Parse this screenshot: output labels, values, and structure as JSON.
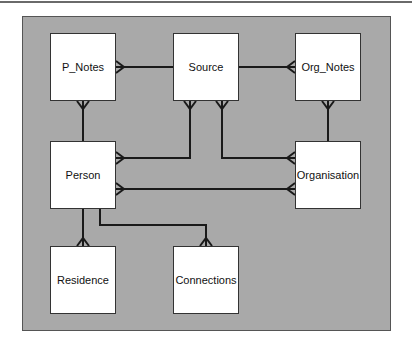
{
  "diagram": {
    "type": "entity-relationship",
    "colors": {
      "background": "#a9a9a9",
      "entity_fill": "#ffffff",
      "line": "#1a1a1a"
    },
    "entities": [
      {
        "id": "p_notes",
        "label": "P_Notes"
      },
      {
        "id": "source",
        "label": "Source"
      },
      {
        "id": "org_notes",
        "label": "Org_Notes"
      },
      {
        "id": "person",
        "label": "Person"
      },
      {
        "id": "organisation",
        "label": "Organisation"
      },
      {
        "id": "residence",
        "label": "Residence"
      },
      {
        "id": "connections",
        "label": "Connections"
      }
    ],
    "relationships": [
      {
        "from": "Source",
        "to": "P_Notes",
        "cardinality": "one-to-many"
      },
      {
        "from": "Source",
        "to": "Org_Notes",
        "cardinality": "one-to-many"
      },
      {
        "from": "Person",
        "to": "P_Notes",
        "cardinality": "one-to-many"
      },
      {
        "from": "Source",
        "to": "Person",
        "cardinality": "many-to-many"
      },
      {
        "from": "Source",
        "to": "Organisation",
        "cardinality": "many-to-many"
      },
      {
        "from": "Org_Notes",
        "to": "Organisation",
        "cardinality": "many-to-one"
      },
      {
        "from": "Person",
        "to": "Organisation",
        "cardinality": "many-to-many"
      },
      {
        "from": "Person",
        "to": "Residence",
        "cardinality": "one-to-many"
      },
      {
        "from": "Person",
        "to": "Connections",
        "cardinality": "one-to-many"
      }
    ]
  }
}
